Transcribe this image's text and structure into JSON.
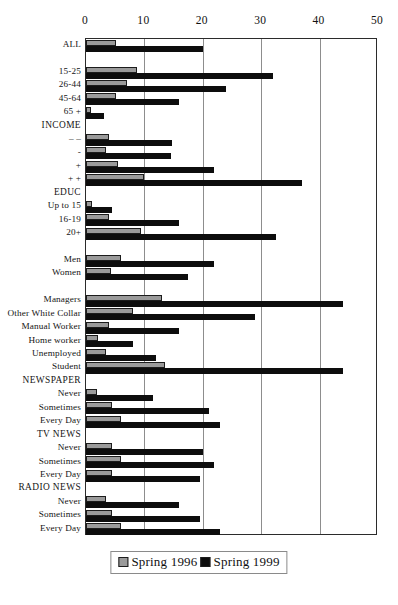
{
  "chart_data": {
    "type": "bar",
    "orientation": "horizontal",
    "title": "",
    "xlabel": "",
    "ylabel": "",
    "xlim": [
      0,
      50
    ],
    "xticks": [
      0,
      10,
      20,
      30,
      40,
      50
    ],
    "xtick_labels": [
      "0",
      "10",
      "20",
      "30",
      "40",
      "50"
    ],
    "grid": true,
    "grid_axis": "x",
    "legend_position": "bottom-center",
    "series": [
      {
        "name": "Spring 1996",
        "color": "#9a9a9a",
        "values": [
          5.1,
          null,
          8.8,
          7.0,
          5.2,
          0.8,
          null,
          4.0,
          3.5,
          5.5,
          10.0,
          null,
          1.0,
          4.0,
          9.5,
          null,
          6.0,
          4.2,
          null,
          13.0,
          8.0,
          4.0,
          2.0,
          3.5,
          13.5,
          null,
          1.8,
          4.5,
          6.0,
          null,
          4.5,
          6.0,
          4.5,
          null,
          3.5,
          4.5,
          6.0
        ]
      },
      {
        "name": "Spring 1999",
        "color": "#0d0d0d",
        "values": [
          20.0,
          null,
          32.0,
          24.0,
          16.0,
          3.0,
          null,
          14.7,
          14.5,
          22.0,
          37.0,
          null,
          4.5,
          16.0,
          32.5,
          null,
          22.0,
          17.5,
          null,
          44.0,
          29.0,
          16.0,
          8.0,
          12.0,
          44.0,
          null,
          11.5,
          21.0,
          23.0,
          null,
          20.0,
          22.0,
          19.5,
          null,
          16.0,
          19.5,
          23.0
        ]
      }
    ],
    "categories": [
      "ALL",
      "",
      "15-25",
      "26-44",
      "45-64",
      "65 +",
      "INCOME",
      "– –",
      "-",
      "+",
      "+ +",
      "EDUC",
      "Up to 15",
      "16-19",
      "20+",
      "",
      "Men",
      "Women",
      "",
      "Managers",
      "Other White Collar",
      "Manual Worker",
      "Home worker",
      "Unemployed",
      "Student",
      "NEWSPAPER",
      "Never",
      "Sometimes",
      "Every Day",
      "TV NEWS",
      "Never",
      "Sometimes",
      "Every Day",
      "RADIO NEWS",
      "Never",
      "Sometimes",
      "Every Day"
    ],
    "section_headers": [
      "INCOME",
      "EDUC",
      "NEWSPAPER",
      "TV NEWS",
      "RADIO NEWS"
    ]
  },
  "legend": {
    "items": [
      {
        "label": "Spring 1996",
        "swatch": "s1996"
      },
      {
        "label": "Spring 1999",
        "swatch": "s1999"
      }
    ]
  }
}
